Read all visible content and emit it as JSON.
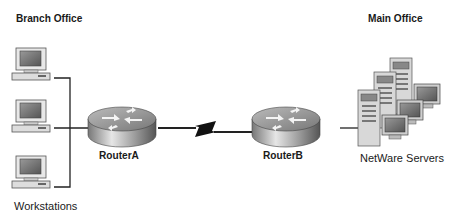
{
  "diagram": {
    "branch_office_label": "Branch Office",
    "main_office_label": "Main Office",
    "workstations_label": "Workstations",
    "routerA_label": "RouterA",
    "routerB_label": "RouterB",
    "servers_label": "NetWare Servers",
    "nodes": [
      {
        "id": "ws1",
        "type": "workstation"
      },
      {
        "id": "ws2",
        "type": "workstation"
      },
      {
        "id": "ws3",
        "type": "workstation"
      },
      {
        "id": "routerA",
        "type": "router"
      },
      {
        "id": "routerB",
        "type": "router"
      },
      {
        "id": "servers",
        "type": "server-cluster"
      }
    ],
    "links": [
      {
        "from": "ws1",
        "to": "routerA",
        "type": "ethernet"
      },
      {
        "from": "ws2",
        "to": "routerA",
        "type": "ethernet"
      },
      {
        "from": "ws3",
        "to": "routerA",
        "type": "ethernet"
      },
      {
        "from": "routerA",
        "to": "routerB",
        "type": "serial-wan"
      },
      {
        "from": "routerB",
        "to": "servers",
        "type": "ethernet"
      }
    ]
  }
}
